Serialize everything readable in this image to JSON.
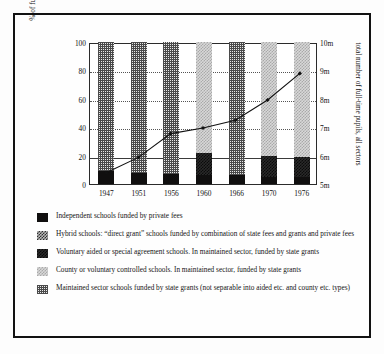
{
  "chart_data": {
    "type": "bar",
    "title": "",
    "subtitle": "",
    "ylabel": "% of full-time pupils by type of school",
    "ylabel_right": "total number of full-time pupils, all sectors",
    "xlabel": "",
    "categories": [
      "1947",
      "1951",
      "1956",
      "1960",
      "1966",
      "1970",
      "1976"
    ],
    "ylim": [
      0,
      100
    ],
    "yticks": [
      0,
      20,
      40,
      60,
      80,
      100
    ],
    "ytick_labels": [
      "0",
      "20",
      "40",
      "60",
      "80",
      "100"
    ],
    "ylim_right": [
      5,
      10
    ],
    "yticks_right": [
      5,
      6,
      7,
      8,
      9,
      10
    ],
    "ytick_labels_right": [
      "5m",
      "6m",
      "7m",
      "8m",
      "9m",
      "10m"
    ],
    "grid": "horizontal dotted at 20, 40, 60, 80; solid at 20",
    "legend_position": "below",
    "stacked": true,
    "series": [
      {
        "name": "Independent schools funded by private fees",
        "key": "independent",
        "pattern": "solid-black",
        "color": "#100f0f",
        "values": [
          9,
          8,
          7,
          6.5,
          6,
          5,
          5
        ]
      },
      {
        "name": "Hybrid schools: \"direct grant\" schools funded by combination of state fees and grants and private fees",
        "key": "hybrid",
        "pattern": "checker-dark",
        "color": "#2f2f2f",
        "values": [
          0,
          0,
          0,
          0,
          0,
          0,
          0
        ]
      },
      {
        "name": "Voluntary aided or special agreement schools. In maintained sector, funded by state grants",
        "key": "aided",
        "pattern": "checker-darker",
        "color": "#2a2a2a",
        "values": [
          0,
          0,
          0,
          15,
          0,
          15,
          14
        ]
      },
      {
        "name": "County or voluntary controlled schools. In maintained sector, funded by state grants",
        "key": "county",
        "pattern": "checker-light",
        "color": "#d8d8d8",
        "values": [
          0,
          0,
          0,
          78.5,
          0,
          80,
          81
        ]
      },
      {
        "name": "Maintained sector schools funded by state grants (not separable into aided etc. and county etc. types)",
        "key": "maintained",
        "pattern": "fine-grid",
        "color": "#e8e8e8",
        "values": [
          91,
          92,
          93,
          0,
          94,
          0,
          0
        ]
      }
    ],
    "line_series": {
      "name": "total number of full-time pupils, all sectors",
      "axis": "right",
      "unit": "millions",
      "x": [
        "1947",
        "1951",
        "1956",
        "1960",
        "1966",
        "1970",
        "1976"
      ],
      "values_millions": [
        5.4,
        5.95,
        6.8,
        7.0,
        7.28,
        8.0,
        8.95
      ],
      "values_pct_scale": [
        8,
        19,
        36,
        40,
        45.5,
        60,
        79
      ],
      "marker": "diamond",
      "color": "#111111"
    }
  },
  "legend": {
    "items": [
      {
        "swatch": "independent-swatch",
        "label": "Independent schools funded by private fees"
      },
      {
        "swatch": "hybrid-swatch",
        "label": "Hybrid schools: “direct grant” schools funded by combination of state fees and grants and private fees"
      },
      {
        "swatch": "aided-swatch",
        "label": "Voluntary aided or special agreement schools. In maintained sector, funded by state grants"
      },
      {
        "swatch": "county-swatch",
        "label": "County or voluntary controlled schools. In maintained sector, funded by state grants"
      },
      {
        "swatch": "maintained-swatch",
        "label": "Maintained sector schools funded by state grants (not separable into aided etc. and county etc. types)"
      }
    ]
  }
}
